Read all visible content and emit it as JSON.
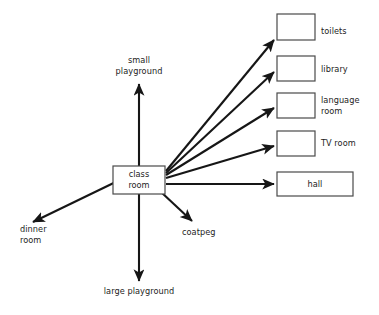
{
  "diagram": {
    "type": "radial-concept-map",
    "center_node": {
      "id": "class-room",
      "label": "class\nroom",
      "shape": "rectangle",
      "x": 113,
      "y": 166,
      "width": 52,
      "height": 28
    },
    "boxed_destinations": [
      {
        "id": "toilets",
        "label": "toilets",
        "label_position": "right-outside",
        "box": {
          "x": 277,
          "y": 14,
          "width": 38,
          "height": 26
        },
        "label_xy": {
          "x": 321,
          "y": 24
        }
      },
      {
        "id": "library",
        "label": "library",
        "label_position": "right-outside",
        "box": {
          "x": 277,
          "y": 56,
          "width": 38,
          "height": 25
        },
        "label_xy": {
          "x": 321,
          "y": 65
        }
      },
      {
        "id": "language-room",
        "label": "language\nroom",
        "label_position": "right-outside",
        "box": {
          "x": 277,
          "y": 93,
          "width": 38,
          "height": 25
        },
        "label_xy": {
          "x": 321,
          "y": 95
        }
      },
      {
        "id": "tv-room",
        "label": "TV room",
        "label_position": "right-outside",
        "box": {
          "x": 277,
          "y": 131,
          "width": 38,
          "height": 25
        },
        "label_xy": {
          "x": 321,
          "y": 138
        }
      },
      {
        "id": "hall",
        "label": "hall",
        "label_position": "inside",
        "box": {
          "x": 277,
          "y": 172,
          "width": 76,
          "height": 24
        }
      }
    ],
    "plain_destinations": [
      {
        "id": "small-playground",
        "label": "small\nplayground",
        "x": 107,
        "y": 55,
        "width": 64,
        "align": "center"
      },
      {
        "id": "dinner-room",
        "label": "dinner\nroom",
        "x": 20,
        "y": 224,
        "width": 56,
        "align": "left"
      },
      {
        "id": "coatpeg",
        "label": "coatpeg",
        "x": 182,
        "y": 227,
        "width": 48,
        "align": "left"
      },
      {
        "id": "large-playground",
        "label": "large playground",
        "x": 100,
        "y": 286,
        "width": 78,
        "align": "center"
      }
    ],
    "arrows": [
      {
        "id": "arrow-to-toilets",
        "from": "class-room",
        "to": "toilets"
      },
      {
        "id": "arrow-to-library",
        "from": "class-room",
        "to": "library"
      },
      {
        "id": "arrow-to-language-room",
        "from": "class-room",
        "to": "language-room"
      },
      {
        "id": "arrow-to-tv-room",
        "from": "class-room",
        "to": "tv-room"
      },
      {
        "id": "arrow-to-hall",
        "from": "class-room",
        "to": "hall"
      },
      {
        "id": "arrow-to-small-playground",
        "from": "class-room",
        "to": "small-playground"
      },
      {
        "id": "arrow-to-dinner-room",
        "from": "class-room",
        "to": "dinner-room"
      },
      {
        "id": "arrow-to-coatpeg",
        "from": "class-room",
        "to": "coatpeg"
      },
      {
        "id": "arrow-to-large-playground",
        "from": "class-room",
        "to": "large-playground"
      }
    ],
    "colors": {
      "background": "#ffffff",
      "line": "#161616",
      "box_stroke": "#4a4a4a",
      "text": "#1d1d1d"
    }
  }
}
